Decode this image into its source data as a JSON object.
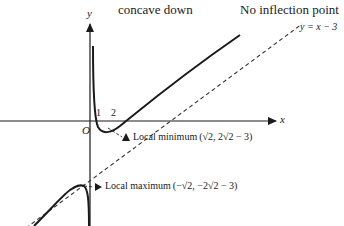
{
  "header": {
    "concavity_label": "concave down",
    "inflection_label": "No inflection point"
  },
  "axes": {
    "x_label": "x",
    "y_label": "y",
    "origin_label": "O",
    "ticks": [
      "1",
      "2"
    ]
  },
  "asymptote": {
    "label": "y = x − 3",
    "style": "dashed"
  },
  "annotations": {
    "local_min": {
      "text": "Local minimum",
      "point": "(√2, 2√2 − 3)"
    },
    "local_max": {
      "text": "Local maximum",
      "point": "(−√2, −2√2 − 3)"
    }
  },
  "colors": {
    "curve": "#1a1a1a",
    "axes": "#1a1a1a",
    "asymptote": "#333333",
    "background": "#ffffff"
  }
}
